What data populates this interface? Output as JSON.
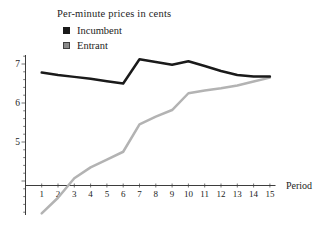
{
  "chart_data": {
    "type": "line",
    "title": "Per-minute prices in cents",
    "xlabel": "Period",
    "ylabel": "",
    "x": [
      1,
      2,
      3,
      4,
      5,
      6,
      7,
      8,
      9,
      10,
      11,
      12,
      13,
      14,
      15
    ],
    "series": [
      {
        "name": "Incumbent",
        "color": "#1a1a1a",
        "swatch_color": "#1a1a1a",
        "values": [
          6.78,
          6.72,
          6.67,
          6.62,
          6.56,
          6.5,
          7.12,
          7.05,
          6.98,
          7.07,
          6.95,
          6.82,
          6.72,
          6.68,
          6.68
        ]
      },
      {
        "name": "Entrant",
        "color": "#b3b3b3",
        "swatch_color": "#8a8a8a",
        "swatch_border": "#3f3f3f",
        "values": [
          3.17,
          3.57,
          4.07,
          4.35,
          4.55,
          4.75,
          5.45,
          5.65,
          5.82,
          6.25,
          6.32,
          6.38,
          6.45,
          6.55,
          6.65
        ]
      }
    ],
    "yticks": [
      5,
      6,
      7
    ],
    "ylim": [
      3.1,
      7.25
    ],
    "xlim": [
      1,
      15
    ],
    "grid": false,
    "legend_position": "top-left"
  }
}
